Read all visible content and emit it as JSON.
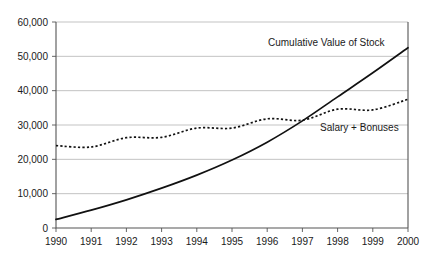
{
  "chart_data": {
    "type": "line",
    "title": "",
    "xlabel": "",
    "ylabel": "",
    "x": [
      1990,
      1991,
      1992,
      1993,
      1994,
      1995,
      1996,
      1997,
      1998,
      1999,
      2000
    ],
    "categories": [
      "1990",
      "1991",
      "1992",
      "1993",
      "1994",
      "1995",
      "1996",
      "1997",
      "1998",
      "1999",
      "2000"
    ],
    "xlim": [
      1990,
      2000
    ],
    "ylim": [
      0,
      60000
    ],
    "y_ticks": [
      0,
      10000,
      20000,
      30000,
      40000,
      50000,
      60000
    ],
    "y_tick_labels": [
      "0",
      "10,000",
      "20,000",
      "30,000",
      "40,000",
      "50,000",
      "60,000"
    ],
    "grid": "horizontal",
    "legend_position": "inline-annotation",
    "series": [
      {
        "name": "Cumulative Value of Stock",
        "style": "solid",
        "color": "#111111",
        "values": [
          2500,
          5200,
          8200,
          11600,
          15400,
          19800,
          25000,
          31200,
          38200,
          45200,
          52500
        ]
      },
      {
        "name": "Salary + Bonuses",
        "style": "dotted",
        "color": "#111111",
        "values": [
          24000,
          23600,
          26300,
          26400,
          29100,
          29100,
          31800,
          31400,
          34600,
          34400,
          37500
        ]
      }
    ],
    "annotations": [
      {
        "id": "cumulative-value-of-stock-label",
        "text": "Cumulative Value of Stock",
        "x_px": 268,
        "y_px": 46
      },
      {
        "id": "salary-plus-bonuses-label",
        "text": "Salary + Bonuses",
        "x_px": 320,
        "y_px": 131
      }
    ],
    "colors": {
      "background": "#ffffff",
      "gridline": "#b4b4b4",
      "axis": "#555555",
      "text": "#1a1a1a",
      "series": "#111111"
    }
  }
}
